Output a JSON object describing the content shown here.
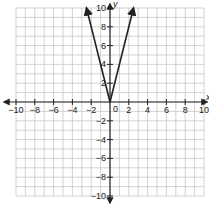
{
  "chart_data": {
    "type": "line",
    "title": "",
    "xlabel": "x",
    "ylabel": "y",
    "xlim": [
      -10,
      10
    ],
    "ylim": [
      -10,
      10
    ],
    "grid": true,
    "x_ticks": [
      -10,
      -8,
      -6,
      -4,
      -2,
      0,
      2,
      4,
      6,
      8,
      10
    ],
    "y_ticks": [
      -10,
      -8,
      -6,
      -4,
      -2,
      2,
      4,
      6,
      8,
      10
    ],
    "series": [
      {
        "name": "y = 4|x|",
        "x": [
          -2.5,
          0,
          2.5
        ],
        "y": [
          10,
          0,
          10
        ],
        "color": "#222222",
        "arrows": true
      }
    ],
    "origin_label": "0"
  },
  "colors": {
    "grid": "#c8c8c8",
    "axis": "#222222",
    "line": "#222222"
  }
}
